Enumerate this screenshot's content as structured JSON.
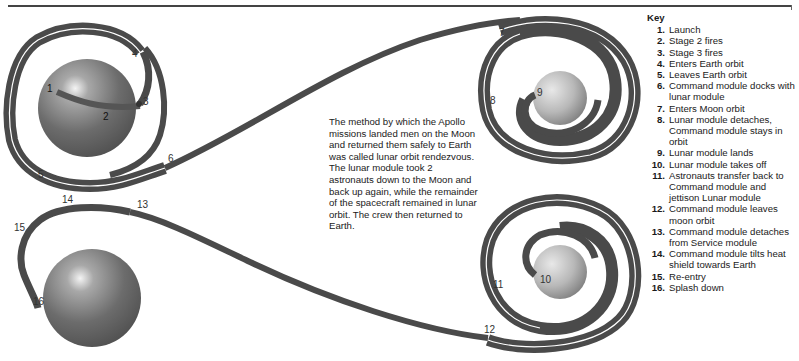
{
  "diagram": {
    "bodies": [
      {
        "id": "earth-launch",
        "label": "Earth",
        "cx": 87,
        "cy": 108,
        "r": 49
      },
      {
        "id": "moon-arrival",
        "label": "Moon",
        "cx": 560,
        "cy": 98,
        "r": 27
      },
      {
        "id": "moon-departure",
        "label": "Moon",
        "cx": 560,
        "cy": 272,
        "r": 27
      },
      {
        "id": "earth-return",
        "label": "Earth",
        "cx": 92,
        "cy": 298,
        "r": 49
      }
    ],
    "step_labels": [
      {
        "n": "1",
        "x": 47,
        "y": 92
      },
      {
        "n": "2",
        "x": 103,
        "y": 120
      },
      {
        "n": "3",
        "x": 143,
        "y": 105
      },
      {
        "n": "4",
        "x": 132,
        "y": 57
      },
      {
        "n": "5",
        "x": 38,
        "y": 178
      },
      {
        "n": "6",
        "x": 168,
        "y": 162
      },
      {
        "n": "7",
        "x": 499,
        "y": 36
      },
      {
        "n": "8",
        "x": 490,
        "y": 104
      },
      {
        "n": "9",
        "x": 537,
        "y": 96
      },
      {
        "n": "10",
        "x": 540,
        "y": 283
      },
      {
        "n": "11",
        "x": 493,
        "y": 288
      },
      {
        "n": "12",
        "x": 484,
        "y": 333
      },
      {
        "n": "13",
        "x": 137,
        "y": 208
      },
      {
        "n": "14",
        "x": 62,
        "y": 203
      },
      {
        "n": "15",
        "x": 14,
        "y": 231
      },
      {
        "n": "16",
        "x": 33,
        "y": 305
      }
    ]
  },
  "description": "The method by which the Apollo missions landed men on the Moon and returned them safely to Earth was called lunar orbit rendezvous. The lunar module took 2 astronauts down to the Moon and back up again, while the remainder of the spacecraft remained in lunar orbit. The crew then returned to Earth.",
  "key": {
    "title": "Key",
    "items": [
      {
        "n": "1.",
        "text": "Launch"
      },
      {
        "n": "2.",
        "text": "Stage 2 fires"
      },
      {
        "n": "3.",
        "text": "Stage 3 fires"
      },
      {
        "n": "4.",
        "text": "Enters Earth orbit"
      },
      {
        "n": "5.",
        "text": "Leaves Earth orbit"
      },
      {
        "n": "6.",
        "text": "Command module docks with lunar module"
      },
      {
        "n": "7.",
        "text": "Enters Moon orbit"
      },
      {
        "n": "8.",
        "text": "Lunar module detaches, Command module stays in orbit"
      },
      {
        "n": "9.",
        "text": "Lunar module lands"
      },
      {
        "n": "10.",
        "text": "Lunar module takes off"
      },
      {
        "n": "11.",
        "text": "Astronauts transfer back to Command module and jettison Lunar module"
      },
      {
        "n": "12.",
        "text": "Command module leaves moon orbit"
      },
      {
        "n": "13.",
        "text": "Command module detaches from Service module"
      },
      {
        "n": "14.",
        "text": "Command module tilts heat shield towards Earth"
      },
      {
        "n": "15.",
        "text": "Re-entry"
      },
      {
        "n": "16.",
        "text": "Splash down"
      }
    ]
  },
  "colors": {
    "track": "#4a4a4a",
    "earth": "#6e6e6e",
    "moon": "#b5b5b5",
    "rule": "#444444"
  }
}
